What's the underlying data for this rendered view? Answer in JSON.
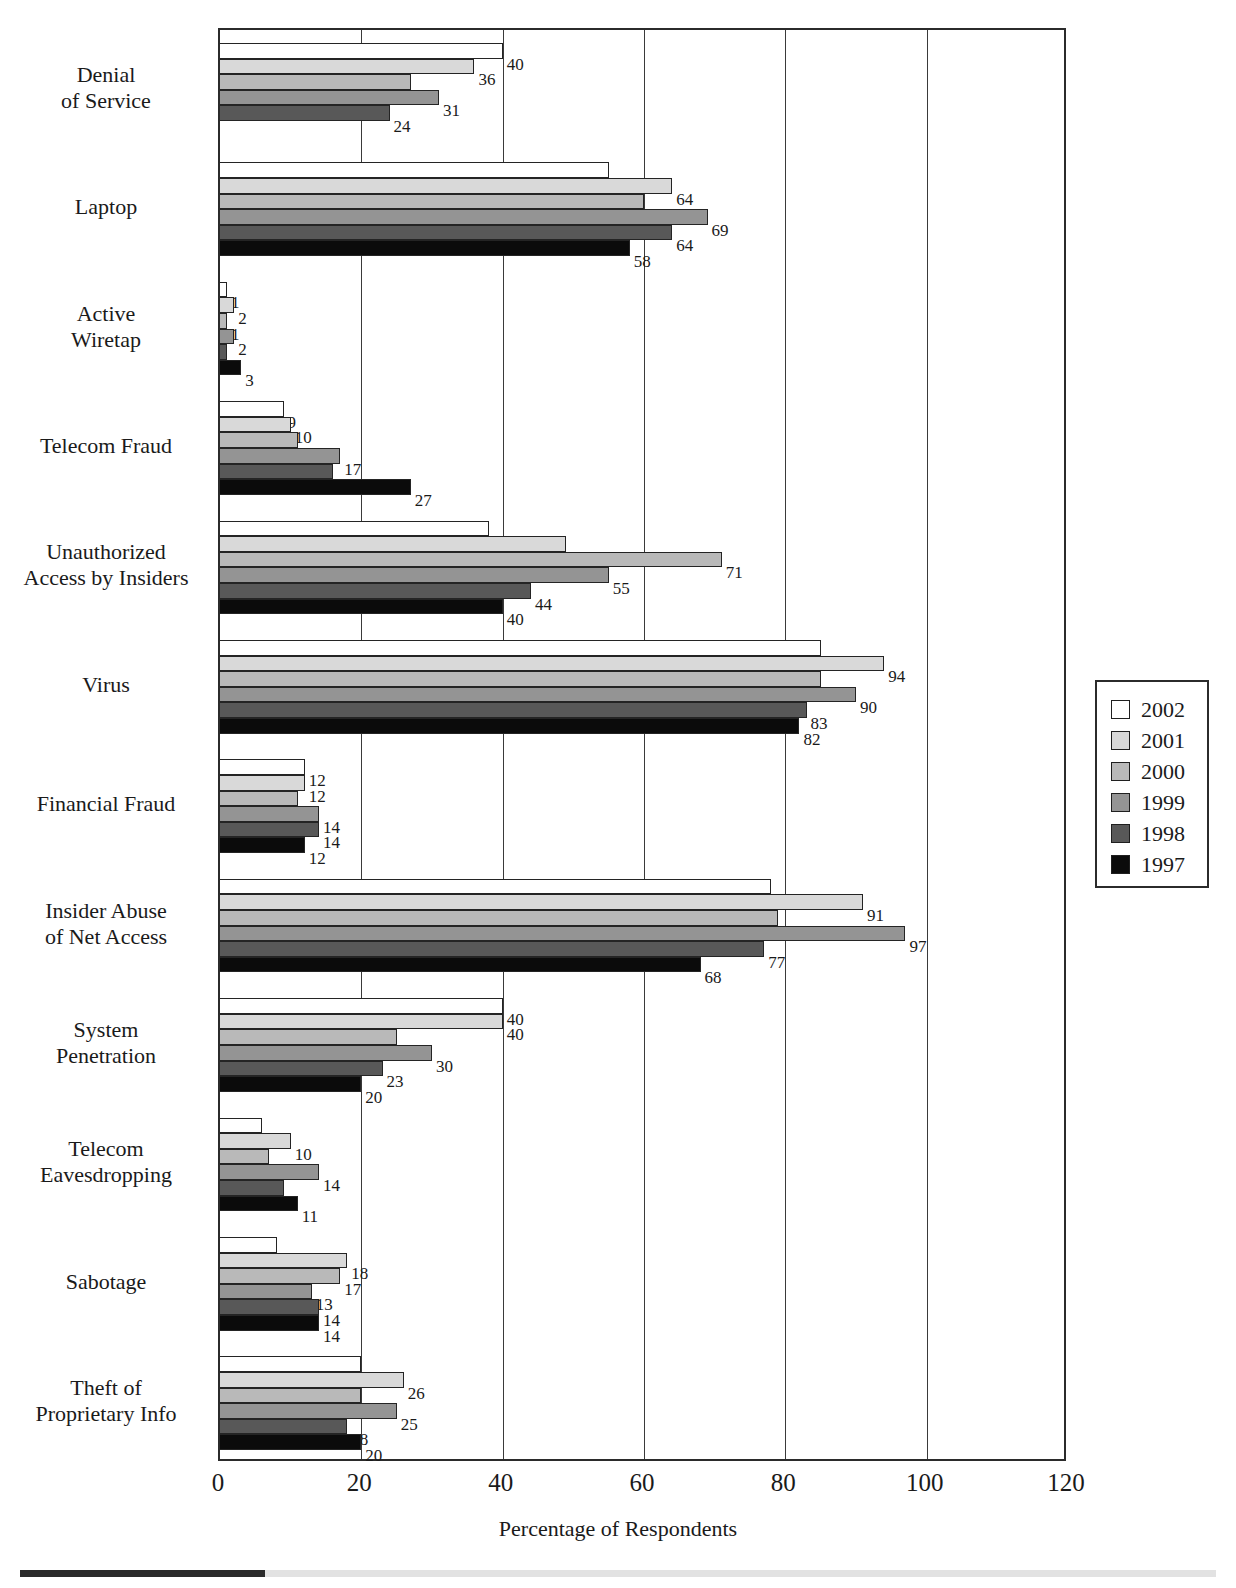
{
  "chart_data": {
    "type": "bar",
    "orientation": "horizontal",
    "grouped": true,
    "title": "",
    "xlabel": "Percentage of Respondents",
    "ylabel": "",
    "xlim": [
      0,
      120
    ],
    "xticks": [
      "0",
      "20",
      "40",
      "60",
      "80",
      "100",
      "120"
    ],
    "grid": "vertical",
    "legend_position": "right",
    "series": [
      {
        "name": "2002",
        "color": "#ffffff",
        "values": [
          40,
          55,
          1,
          9,
          38,
          85,
          12,
          78,
          40,
          6,
          8,
          20
        ]
      },
      {
        "name": "2001",
        "color": "#d9d9d9",
        "values": [
          36,
          64,
          2,
          10,
          49,
          94,
          12,
          91,
          40,
          10,
          18,
          26
        ]
      },
      {
        "name": "2000",
        "color": "#b9b9b9",
        "values": [
          27,
          60,
          1,
          11,
          71,
          85,
          11,
          79,
          25,
          7,
          17,
          20
        ]
      },
      {
        "name": "1999",
        "color": "#949494",
        "values": [
          31,
          69,
          2,
          17,
          55,
          90,
          14,
          97,
          30,
          14,
          13,
          25
        ]
      },
      {
        "name": "1998",
        "color": "#585858",
        "values": [
          24,
          64,
          1,
          16,
          44,
          83,
          14,
          77,
          23,
          9,
          14,
          18
        ]
      },
      {
        "name": "1997",
        "color": "#0b0b0b",
        "values": [
          null,
          58,
          3,
          27,
          40,
          82,
          12,
          68,
          20,
          11,
          14,
          20
        ]
      }
    ],
    "categories": [
      "Denial\nof Service",
      "Laptop",
      "Active\nWiretap",
      "Telecom Fraud",
      "Unauthorized\nAccess by Insiders",
      "Virus",
      "Financial Fraud",
      "Insider Abuse\nof Net Access",
      "System\nPenetration",
      "Telecom\nEavesdropping",
      "Sabotage",
      "Theft of\nProprietary Info"
    ],
    "category_labels": [
      [
        "Denial",
        "of Service"
      ],
      [
        "Laptop"
      ],
      [
        "Active",
        "Wiretap"
      ],
      [
        "Telecom Fraud"
      ],
      [
        "Unauthorized",
        "Access by Insiders"
      ],
      [
        "Virus"
      ],
      [
        "Financial Fraud"
      ],
      [
        "Insider Abuse",
        "of Net Access"
      ],
      [
        "System",
        "Penetration"
      ],
      [
        "Telecom",
        "Eavesdropping"
      ],
      [
        "Sabotage"
      ],
      [
        "Theft of",
        "Proprietary Info"
      ]
    ]
  },
  "axis": {
    "x_title": "Percentage of Respondents",
    "x_ticks": [
      "0",
      "20",
      "40",
      "60",
      "80",
      "100",
      "120"
    ]
  },
  "legend": {
    "entries": [
      {
        "label": "2002",
        "color": "#ffffff"
      },
      {
        "label": "2001",
        "color": "#d9d9d9"
      },
      {
        "label": "2000",
        "color": "#b9b9b9"
      },
      {
        "label": "1999",
        "color": "#949494"
      },
      {
        "label": "1998",
        "color": "#585858"
      },
      {
        "label": "1997",
        "color": "#0b0b0b"
      }
    ]
  }
}
